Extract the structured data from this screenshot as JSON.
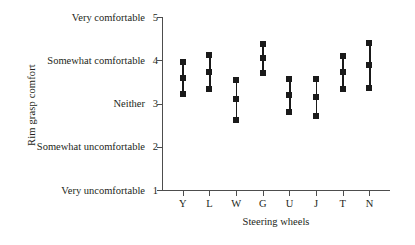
{
  "chart_data": {
    "type": "scatter",
    "title": "",
    "xlabel": "Steering wheels",
    "ylabel": "Rim grasp comfort",
    "grid": false,
    "legend": null,
    "ylim": [
      1,
      5
    ],
    "ytick_values": [
      5,
      4,
      3,
      2,
      1
    ],
    "ytick_labels": [
      "Very comfortable",
      "Somewhat comfortable",
      "Neither",
      "Somewhat uncomfortable",
      "Very uncomfortable"
    ],
    "categories": [
      "Y",
      "L",
      "W",
      "G",
      "U",
      "J",
      "T",
      "N"
    ],
    "series": [
      {
        "name": "upper",
        "values": [
          3.96,
          4.12,
          3.54,
          4.38,
          3.57,
          3.57,
          4.1,
          4.4
        ]
      },
      {
        "name": "mean",
        "values": [
          3.59,
          3.73,
          3.1,
          4.05,
          3.2,
          3.15,
          3.73,
          3.89
        ]
      },
      {
        "name": "lower",
        "values": [
          3.22,
          3.34,
          2.62,
          3.7,
          2.8,
          2.71,
          3.34,
          3.36
        ]
      }
    ],
    "marker": "square",
    "marker_color": "#1a1a1a",
    "axis_color": "#4d4d4d"
  }
}
